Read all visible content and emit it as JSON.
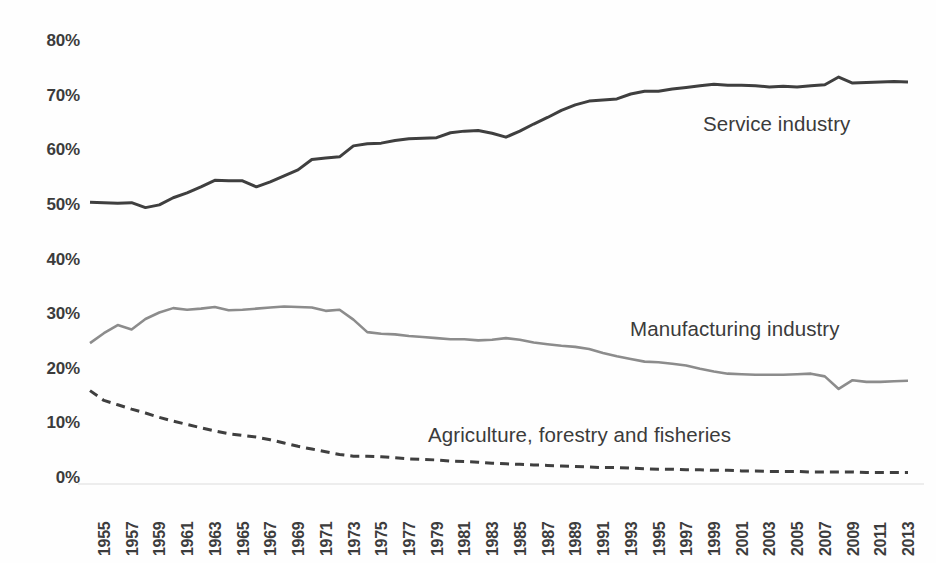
{
  "chart_data": {
    "type": "line",
    "title": "",
    "subtitle": "",
    "xlabel": "",
    "ylabel": "",
    "grid": false,
    "legend_position": "inline-annotations",
    "ylim": [
      0,
      80
    ],
    "ytick_labels": [
      "80%",
      "70%",
      "60%",
      "50%",
      "40%",
      "30%",
      "20%",
      "10%",
      "0%"
    ],
    "ytick_values": [
      80,
      70,
      60,
      50,
      40,
      30,
      20,
      10,
      0
    ],
    "xlim": [
      1955,
      2014
    ],
    "xtick_labels": [
      "1955",
      "1957",
      "1959",
      "1961",
      "1963",
      "1965",
      "1967",
      "1969",
      "1971",
      "1973",
      "1975",
      "1977",
      "1979",
      "1981",
      "1983",
      "1985",
      "1987",
      "1989",
      "1991",
      "1993",
      "1995",
      "1997",
      "1999",
      "2001",
      "2003",
      "2005",
      "2007",
      "2009",
      "2011",
      "2013"
    ],
    "xtick_values": [
      1955,
      1957,
      1959,
      1961,
      1963,
      1965,
      1967,
      1969,
      1971,
      1973,
      1975,
      1977,
      1979,
      1981,
      1983,
      1985,
      1987,
      1989,
      1991,
      1993,
      1995,
      1997,
      1999,
      2001,
      2003,
      2005,
      2007,
      2009,
      2011,
      2013
    ],
    "x": [
      1955,
      1956,
      1957,
      1958,
      1959,
      1960,
      1961,
      1962,
      1963,
      1964,
      1965,
      1966,
      1967,
      1968,
      1969,
      1970,
      1971,
      1972,
      1973,
      1974,
      1975,
      1976,
      1977,
      1978,
      1979,
      1980,
      1981,
      1982,
      1983,
      1984,
      1985,
      1986,
      1987,
      1988,
      1989,
      1990,
      1991,
      1992,
      1993,
      1994,
      1995,
      1996,
      1997,
      1998,
      1999,
      2000,
      2001,
      2002,
      2003,
      2004,
      2005,
      2006,
      2007,
      2008,
      2009,
      2010,
      2011,
      2012,
      2013,
      2014
    ],
    "series": [
      {
        "name": "Service industry",
        "color": "#3f3f3f",
        "style": "solid",
        "width": 3.0,
        "values": [
          50.5,
          50.4,
          50.3,
          50.4,
          49.5,
          50.0,
          51.3,
          52.2,
          53.3,
          54.5,
          54.4,
          54.4,
          53.3,
          54.2,
          55.3,
          56.4,
          58.3,
          58.6,
          58.8,
          60.8,
          61.2,
          61.3,
          61.8,
          62.1,
          62.2,
          62.3,
          63.2,
          63.5,
          63.6,
          63.1,
          62.4,
          63.5,
          64.8,
          66.0,
          67.3,
          68.3,
          69.0,
          69.2,
          69.4,
          70.3,
          70.8,
          70.8,
          71.2,
          71.5,
          71.8,
          72.1,
          71.9,
          71.9,
          71.8,
          71.6,
          71.7,
          71.6,
          71.8,
          72.0,
          73.4,
          72.3,
          72.4,
          72.5,
          72.6,
          72.5
        ]
      },
      {
        "name": "Manufacturing industry",
        "color": "#8c8c8c",
        "style": "solid",
        "width": 2.6,
        "values": [
          24.7,
          26.5,
          28.0,
          27.2,
          29.1,
          30.3,
          31.1,
          30.8,
          31.0,
          31.3,
          30.7,
          30.8,
          31.0,
          31.2,
          31.4,
          31.3,
          31.2,
          30.6,
          30.8,
          29.0,
          26.7,
          26.4,
          26.3,
          26.0,
          25.8,
          25.6,
          25.4,
          25.4,
          25.2,
          25.3,
          25.6,
          25.3,
          24.8,
          24.5,
          24.2,
          24.0,
          23.6,
          22.9,
          22.3,
          21.8,
          21.3,
          21.2,
          20.9,
          20.6,
          20.0,
          19.5,
          19.1,
          19.0,
          18.9,
          18.9,
          18.9,
          19.0,
          19.1,
          18.6,
          16.3,
          17.9,
          17.6,
          17.6,
          17.7,
          17.8
        ]
      },
      {
        "name": "Agriculture, forestry and fisheries",
        "color": "#3f3f3f",
        "style": "dashed",
        "width": 3.0,
        "values": [
          16.0,
          14.2,
          13.4,
          12.6,
          11.9,
          11.1,
          10.4,
          9.8,
          9.2,
          8.6,
          8.1,
          7.8,
          7.5,
          7.0,
          6.4,
          5.8,
          5.3,
          4.8,
          4.3,
          4.0,
          4.0,
          3.9,
          3.7,
          3.5,
          3.4,
          3.3,
          3.1,
          3.0,
          2.9,
          2.7,
          2.6,
          2.5,
          2.4,
          2.3,
          2.2,
          2.1,
          2.0,
          1.9,
          1.9,
          1.8,
          1.7,
          1.6,
          1.6,
          1.5,
          1.5,
          1.4,
          1.4,
          1.3,
          1.3,
          1.2,
          1.2,
          1.2,
          1.1,
          1.1,
          1.1,
          1.1,
          1.0,
          1.0,
          1.0,
          1.0
        ]
      }
    ]
  },
  "annotations": {
    "service": "Service industry",
    "manufacturing": "Manufacturing industry",
    "agriculture": "Agriculture, forestry and fisheries"
  }
}
